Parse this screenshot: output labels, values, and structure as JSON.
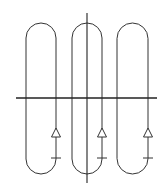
{
  "diagram": {
    "stroke_color": "#333333",
    "background": "#ffffff",
    "axes": {
      "horizontal": {
        "x1": 16,
        "y": 98,
        "x2": 157
      },
      "vertical": {
        "x": 87,
        "y1": 13,
        "y2": 183
      }
    },
    "loops": [
      {
        "id": "loop-1",
        "left": 26,
        "right": 56,
        "top": 23,
        "bottom": 174,
        "arrow_x": 56,
        "arrow_apex_y": 128,
        "arrow_base_y": 137,
        "tick_y": 158
      },
      {
        "id": "loop-2",
        "left": 72,
        "right": 102,
        "top": 23,
        "bottom": 174,
        "arrow_x": 102,
        "arrow_apex_y": 128,
        "arrow_base_y": 137,
        "tick_y": 158
      },
      {
        "id": "loop-3",
        "left": 117,
        "right": 148,
        "top": 23,
        "bottom": 174,
        "arrow_x": 148,
        "arrow_apex_y": 128,
        "arrow_base_y": 137,
        "tick_y": 158
      }
    ],
    "arrow_direction": "up"
  }
}
